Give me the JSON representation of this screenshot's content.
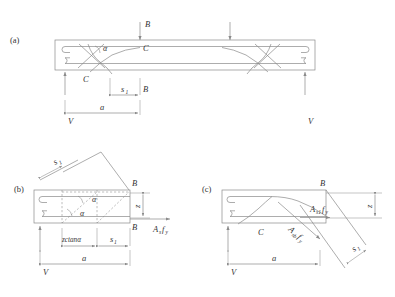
{
  "figure": {
    "type": "engineering-diagram",
    "background_color": "#ffffff",
    "line_color": "#8a8a8a",
    "text_color": "#333333"
  },
  "panels": [
    {
      "id": "a",
      "label": "(a)",
      "description": "Full beam elevation with stirrups, bent-up bars, applied loads and reactions",
      "labels": {
        "load_top": "B",
        "node_c_top": "C",
        "node_c_bottom": "C",
        "angle": "α",
        "dim_s1": "s",
        "dim_s1_sub": "1",
        "dim_s1_right_marker": "B",
        "dim_a": "a",
        "reaction_left": "V",
        "reaction_right": "V"
      }
    },
    {
      "id": "b",
      "label": "(b)",
      "description": "Free body of left segment with vertical stirrups resisting shear",
      "labels": {
        "node_b_top": "B",
        "node_b_bottom": "B",
        "angle_upper": "α",
        "angle_lower": "α",
        "rotated_s1": "s",
        "rotated_s1_sub": "1",
        "dim_z": "z",
        "force_as_fy": "A",
        "force_as_fy_sub": "s",
        "force_as_fy_f": "f",
        "force_as_fy_fsub": "y",
        "dim_zcot": "zctanα",
        "dim_s1": "s",
        "dim_s1_sub": "1",
        "dim_a": "a",
        "reaction_left": "V"
      }
    },
    {
      "id": "c",
      "label": "(c)",
      "description": "Free body of left segment with bent-up bars resisting shear",
      "labels": {
        "node_b_top": "B",
        "node_c": "C",
        "force_as1_fy": "A",
        "force_as1_fy_sub": "s1",
        "force_as1_fy_f": "f",
        "force_as1_fy_fsub": "y",
        "force_asb_fy": "A",
        "force_asb_fy_sub": "sb",
        "force_asb_fy_f": "f",
        "force_asb_fy_fsub": "y",
        "dim_z": "z",
        "rotated_s1": "s",
        "rotated_s1_sub": "1",
        "dim_a": "a",
        "reaction_left": "V"
      }
    }
  ]
}
